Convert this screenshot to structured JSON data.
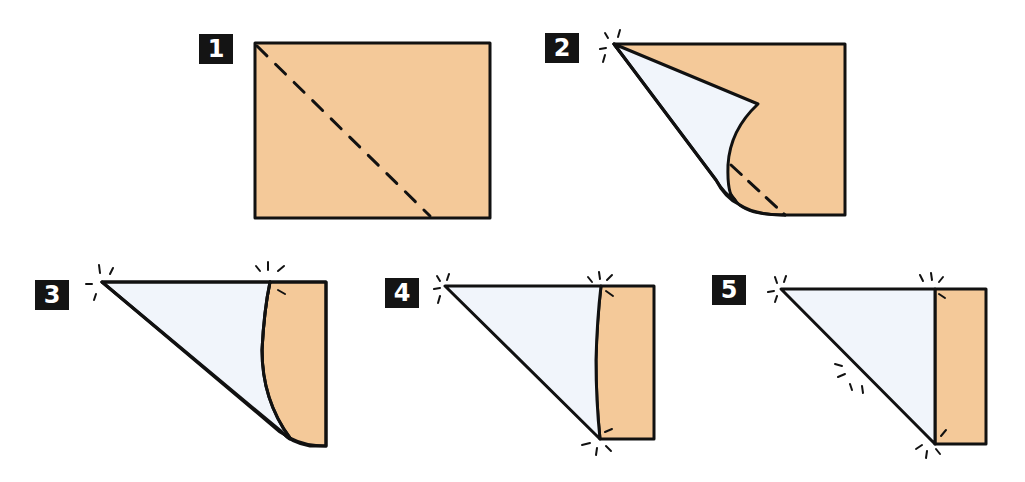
{
  "diagram": {
    "colors": {
      "paper_front": "#f4c999",
      "paper_back": "#f1f5fb",
      "outline": "#111111",
      "badge_bg": "#141414",
      "badge_text": "#ffffff",
      "background": "#ffffff"
    },
    "steps": [
      {
        "number": "1",
        "description": "Rectangle with dashed diagonal fold line from top-left corner"
      },
      {
        "number": "2",
        "description": "Top-left corner folding down along diagonal, curling paper"
      },
      {
        "number": "3",
        "description": "Folded triangle with remaining curved flap on right"
      },
      {
        "number": "4",
        "description": "Triangle with narrow strip on right, crease marks at corners"
      },
      {
        "number": "5",
        "description": "Completed triangle with straight rectangular strip on right, crease marks along diagonal"
      }
    ]
  }
}
